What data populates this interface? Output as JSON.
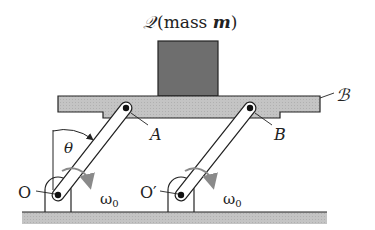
{
  "title_label": {
    "symbol": "𝒬",
    "text": "(mass ",
    "mass_var": "m",
    "close": ")"
  },
  "labels": {
    "platform": "ℬ",
    "pin_a": "A",
    "pin_b": "B",
    "pivot_o": "O",
    "pivot_o_prime": "O′",
    "angle": "θ",
    "omega_left": "ω",
    "omega_left_sub": "0",
    "omega_right": "ω",
    "omega_right_sub": "0"
  },
  "colors": {
    "block": "#6e6e6e",
    "platform": "#c8c8c8",
    "ground": "#b8b8b8",
    "arrow": "#8a8a8a",
    "line": "#222222"
  }
}
